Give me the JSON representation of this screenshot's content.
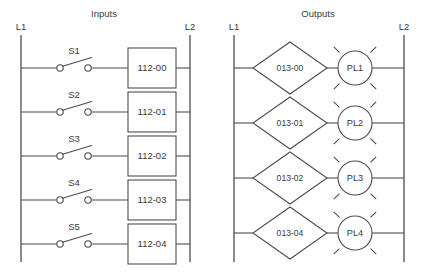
{
  "panels": {
    "inputs": {
      "title": "Inputs",
      "left_rail_label": "L1",
      "right_rail_label": "L2",
      "rungs": [
        {
          "switch": "S1",
          "box": "112-00"
        },
        {
          "switch": "S2",
          "box": "112-01"
        },
        {
          "switch": "S3",
          "box": "112-02"
        },
        {
          "switch": "S4",
          "box": "112-03"
        },
        {
          "switch": "S5",
          "box": "112-04"
        }
      ]
    },
    "outputs": {
      "title": "Outputs",
      "left_rail_label": "L1",
      "right_rail_label": "L2",
      "rungs": [
        {
          "contact": "013-00",
          "lamp": "PL1"
        },
        {
          "contact": "013-01",
          "lamp": "PL2"
        },
        {
          "contact": "013-02",
          "lamp": "PL3"
        },
        {
          "contact": "013-04",
          "lamp": "PL4"
        }
      ]
    }
  },
  "symbols": {
    "switch_icon": "normally-open-switch-icon",
    "box_icon": "output-coil-box-icon",
    "diamond_icon": "contact-diamond-icon",
    "lamp_icon": "pilot-light-icon"
  },
  "colors": {
    "line": "#4d4d4d",
    "text": "#3a3a3a",
    "background": "#ffffff"
  }
}
